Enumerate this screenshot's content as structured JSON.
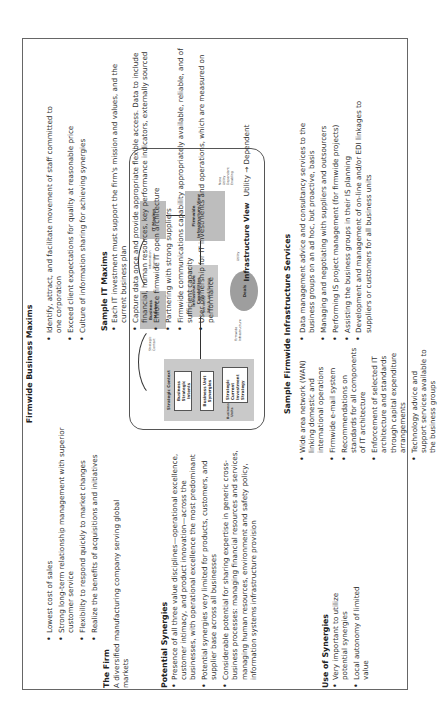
{
  "firm": {
    "heading": "The Firm",
    "text": "A diversified manufacturing company serving global markets"
  },
  "business_maxims": {
    "heading": "Firmwide Business Maxims",
    "left": [
      "Lowest cost of sales",
      "Strong long-term relationship management with superior customer service",
      "Flexibility to respond quickly to market changes",
      "Realize the benefits of acquisitions and initiatives"
    ],
    "right": [
      "Identify, attract, and facilitate movement of staff committed to one corporation",
      "Exceed client expectations for quality at reasonable price",
      "Culture of information sharing for achieving synergies"
    ]
  },
  "potential_synergies": {
    "heading": "Potential Synergies",
    "items": [
      "Presence of all three value disciplines—operational excellence, customer intimacy, and product innovation—across the businesses, with operational excellence the most predominant",
      "Potential synergies very limited for products, customers, and supplier base across all businesses",
      "Considerable potential for sharing expertise in generic cross-business processes: managing financial resources and services, managing human resources, environment and safety policy, information systems infrastructure provision"
    ]
  },
  "use_of_synergies": {
    "heading": "Use of Synergies",
    "items": [
      "Very important to utilize potential synergies",
      "Local autonomy of limited value"
    ]
  },
  "it_maxims": {
    "heading": "Sample IT Maxims",
    "items": [
      "Each IT investment must support the firm's mission and values, and the current business plan",
      "Capture data once and provide appropriate flexible access. Data to include financial, human resources, key performance indicators, externally sourced",
      "Enforce firmwide IT open architecture",
      "Partnering with strong suppliers",
      "Firmwide communications capability appropriately available, reliable, and of sufficient capacity",
      "User ownership for IT investments and operations, which are measured on performance"
    ]
  },
  "infrastructure_view": {
    "label": "Infrastructure View",
    "value": "Utility → Dependent"
  },
  "infrastructure_services": {
    "heading": "Sample Firmwide Infrastructure Services",
    "left": [
      "Wide area network (WAN) linking domestic and international operations",
      "Firmwide e-mail system",
      "Recommendations on standards for all components of IT architecture",
      "Enforcement of selected IT architecture and standards through capital expenditure arrangements",
      "Technology advice and support services available to the business groups"
    ],
    "right": [
      "Data management advice and consultancy services to the business groups on an ad hoc, but proactive, basis",
      "Managing and negotiating with suppliers and outsourcers",
      "Performing IS project management (for firmwide projects)",
      "Assisting the business groups in their IS planning",
      "Development and management of on-line and/or EDI linkages to suppliers or customers for all business units"
    ]
  },
  "diagram": {
    "strategic_context": "Strategic Context",
    "strategic_intents": "Business Strategic Intents",
    "business_unit_synergies": "Business Unit Synergies",
    "strategy_bullets": [
      "Strategic",
      "Current",
      "Investment",
      "Strategy"
    ],
    "business_units": "Business Units",
    "business_maxims": "Business Maxims",
    "it_maxims": "IT Maxims",
    "firmwide_infra_view": "Firmwide Infrastructure View",
    "infra_view_options": [
      "None",
      "Utility",
      "Dependent",
      "Enabling"
    ],
    "infra_capabilities": "Infrastructure Capabilities",
    "infra_cap_bullets": [
      "Services",
      "Reach and Range"
    ],
    "deals": "Deals",
    "conn_labels": [
      "Strategic Context",
      "Information Sharing",
      "Firmwide Infrastructure",
      "Utility"
    ]
  }
}
